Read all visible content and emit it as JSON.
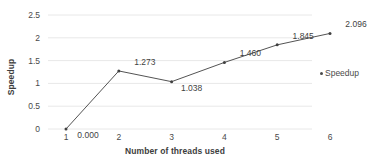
{
  "chart_data": {
    "type": "line",
    "title": "",
    "xlabel": "Number of threads used",
    "ylabel": "Speedup",
    "categories": [
      1,
      2,
      3,
      4,
      5,
      6
    ],
    "x_tick_labels": [
      "1",
      "2",
      "3",
      "4",
      "5",
      "6"
    ],
    "y_tick_labels": [
      "0",
      "0.5",
      "1",
      "1.5",
      "2",
      "2.5"
    ],
    "y_ticks": [
      0,
      0.5,
      1,
      1.5,
      2,
      2.5
    ],
    "ylim": [
      0,
      2.5
    ],
    "xlim": [
      1,
      6
    ],
    "grid": "horizontal",
    "legend_position": "right",
    "series": [
      {
        "name": "Speedup",
        "values": [
          0.0,
          1.273,
          1.038,
          1.46,
          1.845,
          2.096
        ],
        "data_labels": [
          "0.000",
          "1.273",
          "1.038",
          "1.460",
          "1.845",
          "2.096"
        ],
        "line_color": "#404040",
        "marker_color": "#404040"
      }
    ]
  },
  "legend": {
    "entries": [
      {
        "label": "Speedup",
        "marker": "dot-marker"
      }
    ]
  },
  "colors": {
    "line": "#404040",
    "grid": "#e8e8e8",
    "text": "#404040"
  }
}
